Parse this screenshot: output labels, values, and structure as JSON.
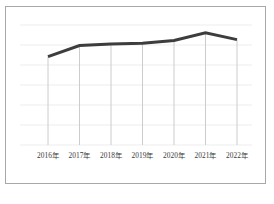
{
  "figure": {
    "width": 274,
    "height": 204,
    "background_color": "#ffffff",
    "frame_color": "#a8a8a8"
  },
  "chart_data": {
    "type": "line",
    "title": "",
    "subtitle": "",
    "xlabel": "",
    "ylabel": "",
    "categories": [
      "2016年",
      "2017年",
      "2018年",
      "2019年",
      "2020年",
      "2021年",
      "2022年"
    ],
    "values": [
      40.0,
      52.5,
      54.2,
      55.0,
      58.3,
      66.7,
      59.2
    ],
    "series": [
      {
        "name": "",
        "color": "#3d3d3d",
        "line_width": 3,
        "values": [
          40.0,
          52.5,
          54.2,
          55.0,
          58.3,
          66.7,
          59.2
        ]
      }
    ],
    "ylim": [
      0,
      100
    ],
    "grid": true,
    "grid_color": "#ededed",
    "droplines": true,
    "dropline_color": "#cccccc",
    "legend": false,
    "legend_position": "none",
    "annotations": []
  },
  "axis": {
    "x_tick_labels": [
      "2016年",
      "2017年",
      "2018年",
      "2019年",
      "2020年",
      "2021年",
      "2022年"
    ],
    "x_tick_label_color": "#3a3a3a",
    "y_tick_labels": []
  }
}
